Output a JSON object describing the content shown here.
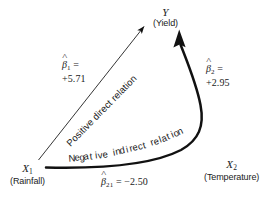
{
  "diagram": {
    "background_color": "#ffffff",
    "line_color": "#111111",
    "nodes": {
      "y": {
        "name": "Y",
        "description": "(Yield)"
      },
      "x1": {
        "name": "X",
        "subscript": "1",
        "description": "(Rainfall)"
      },
      "x2": {
        "name": "X",
        "subscript": "2",
        "description": "(Temperature)"
      }
    },
    "coefficients": {
      "beta1": {
        "symbol": "β",
        "subscript": "1",
        "equals": "=",
        "value": "+5.71"
      },
      "beta2": {
        "symbol": "β",
        "subscript": "2",
        "equals": "=",
        "value": "+2.95"
      },
      "beta21": {
        "symbol": "β",
        "subscript": "21",
        "equals_value": "= −2.50"
      }
    },
    "relations": {
      "direct": "Positive direct relation",
      "indirect": "Negative indirect relation",
      "indirect_letters": [
        "N",
        "e",
        "g",
        "a",
        "t",
        "i",
        "v",
        "e",
        " ",
        "i",
        "n",
        "d",
        "i",
        "r",
        "e",
        "c",
        "t",
        " ",
        "r",
        "e",
        "l",
        "a",
        "t",
        "i",
        "o",
        "n"
      ]
    },
    "arrows": {
      "direct_arrow": "thin-straight-arrow-x1-to-y",
      "indirect_arrow": "thick-curved-arrow-x1-through-x2-to-y"
    }
  }
}
